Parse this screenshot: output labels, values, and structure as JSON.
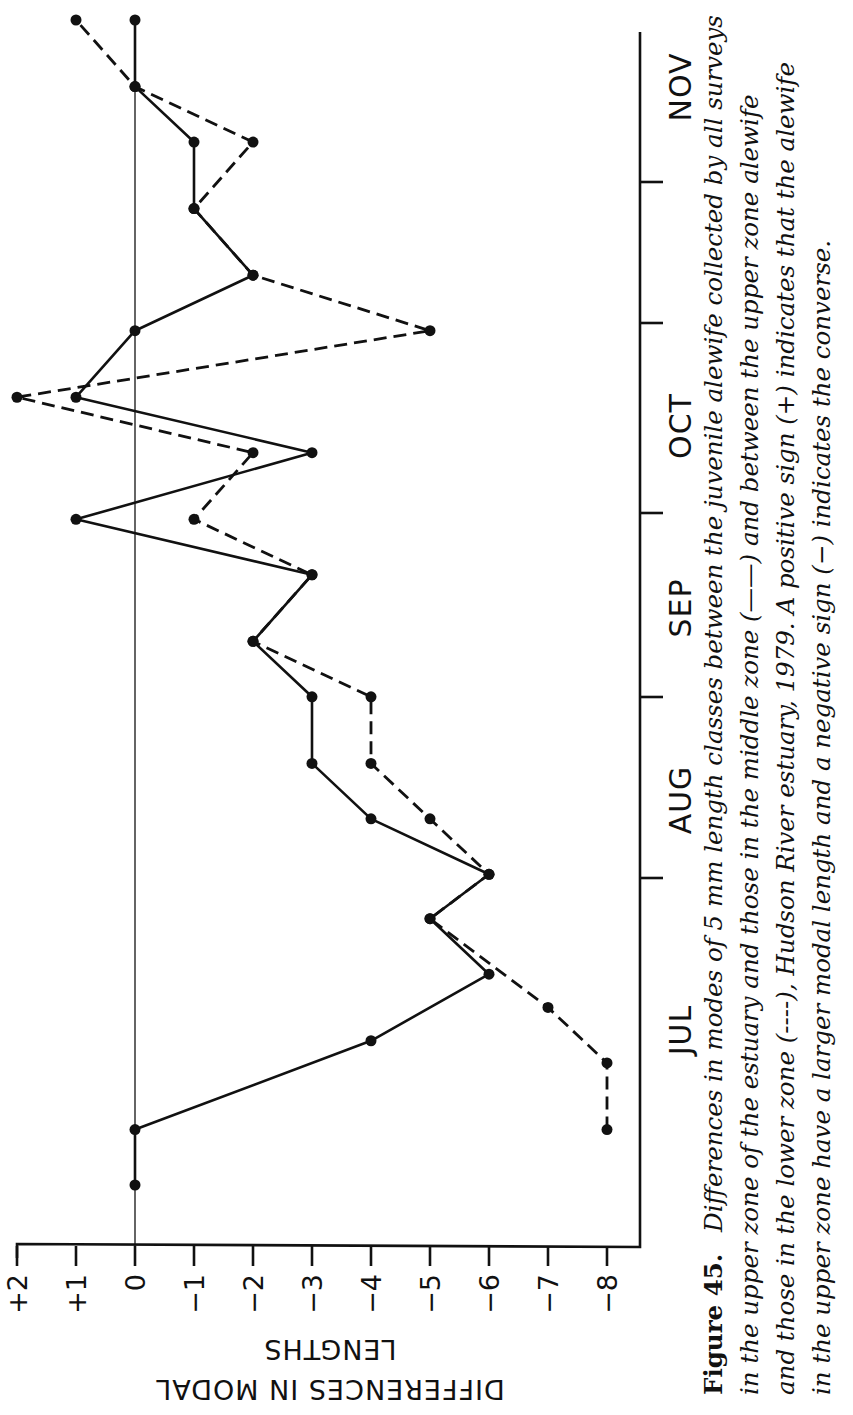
{
  "figure": {
    "number_label": "Figure 45.",
    "caption_lines": [
      "Differences in modes of 5 mm length classes between the juvenile alewife collected by all surveys",
      "in the upper zone of the estuary and those in the middle zone (——) and between the upper zone alewife",
      "and those in the lower zone (----), Hudson River estuary, 1979. A positive sign (+) indicates that the alewife",
      "in the upper zone have a larger modal length and a negative sign (−) indicates the converse."
    ]
  },
  "chart_data": {
    "type": "line",
    "orientation": "rotated-90-ccw",
    "title": "",
    "xlabel": "",
    "ylabel": "DIFFERENCES IN MODAL LENGTHS",
    "ylabel_lines": [
      "DIFFERENCES IN MODAL",
      "LENGTHS"
    ],
    "ylim": [
      -8,
      2
    ],
    "yticks": [
      2,
      1,
      0,
      -1,
      -2,
      -3,
      -4,
      -5,
      -6,
      -7,
      -8
    ],
    "ytick_labels": [
      "+2",
      "+1",
      "0",
      "−1",
      "−2",
      "−3",
      "−4",
      "−5",
      "−6",
      "−7",
      "−8"
    ],
    "months": [
      "JUL",
      "AUG",
      "SEP",
      "OCT",
      "NOV"
    ],
    "reference_line": 0,
    "grid": false,
    "legend": "in caption: solid = upper vs middle zone, dashed = upper vs lower zone",
    "series": [
      {
        "name": "Upper zone vs middle zone",
        "style": "solid",
        "t": [
          0.0,
          0.05,
          0.13,
          0.19,
          0.24,
          0.28,
          0.33,
          0.38,
          0.44,
          0.49,
          0.55,
          0.6,
          0.66,
          0.71,
          0.77,
          0.82,
          0.88,
          0.94,
          0.99,
          1.05
        ],
        "values": [
          0,
          0,
          -4,
          -6,
          -5,
          -6,
          -4,
          -3,
          -3,
          -2,
          -3,
          1,
          -3,
          1,
          0,
          -2,
          -1,
          -1,
          0,
          0
        ]
      },
      {
        "name": "Upper zone vs lower zone",
        "style": "dashed",
        "t": [
          0.05,
          0.11,
          0.16,
          0.24,
          0.28,
          0.33,
          0.38,
          0.44,
          0.49,
          0.55,
          0.6,
          0.66,
          0.71,
          0.77,
          0.82,
          0.88,
          0.94,
          0.99,
          1.05
        ],
        "values": [
          -8,
          -8,
          -7,
          -5,
          -6,
          -5,
          -4,
          -4,
          -2,
          -3,
          -1,
          -2,
          2,
          -5,
          -2,
          -1,
          -2,
          0,
          1
        ]
      }
    ]
  }
}
